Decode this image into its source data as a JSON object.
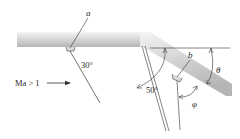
{
  "diagram": {
    "labels": {
      "gauge_a": "a",
      "gauge_b": "b",
      "angle_30": "30°",
      "angle_50": "50°",
      "theta": "θ",
      "phi": "φ",
      "flow": "Ma > 1"
    },
    "colors": {
      "wall_light": "#f2f2f2",
      "wall_dark": "#b8b8b8",
      "line": "#333333"
    }
  }
}
